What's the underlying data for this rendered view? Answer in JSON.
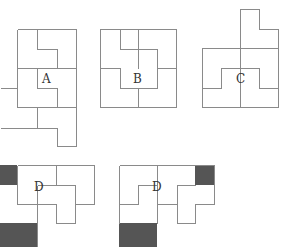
{
  "diagram": {
    "type": "tiling-puzzle-options",
    "line_color": "#8a8a8a",
    "fill_color": "#555555",
    "options": [
      {
        "label": "A"
      },
      {
        "label": "B"
      },
      {
        "label": "C"
      },
      {
        "label": "D"
      },
      {
        "label": "D"
      }
    ]
  }
}
